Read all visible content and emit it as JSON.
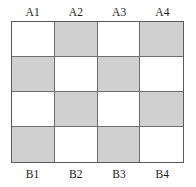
{
  "figure": {
    "top_labels": [
      "A1",
      "A2",
      "A3",
      "A4"
    ],
    "bottom_labels": [
      "B1",
      "B2",
      "B3",
      "B4"
    ]
  },
  "chart_data": {
    "type": "heatmap",
    "title": "",
    "xlabel": "",
    "ylabel": "",
    "rows": 4,
    "columns": 4,
    "categories": [
      "A1",
      "A2",
      "A3",
      "A4"
    ],
    "bottom_categories": [
      "B1",
      "B2",
      "B3",
      "B4"
    ],
    "colors": {
      "shaded": "#d0d0d0",
      "light": "#ffffff",
      "border": "#6e6e6e",
      "outer_border": "#5a5a5a",
      "label_text": "#1a1a1a"
    },
    "legend": [],
    "grid": true,
    "values": [
      [
        0,
        1,
        0,
        1
      ],
      [
        1,
        0,
        1,
        0
      ],
      [
        0,
        1,
        0,
        1
      ],
      [
        1,
        0,
        1,
        0
      ]
    ],
    "value_meaning": {
      "0": "light",
      "1": "shaded"
    }
  }
}
